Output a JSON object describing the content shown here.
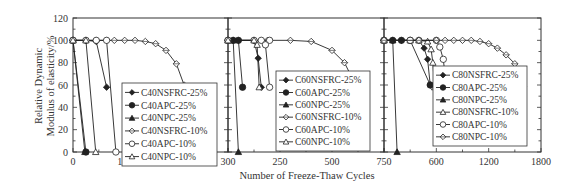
{
  "chart_data": {
    "type": "line",
    "title": "",
    "xlabel": "Number of Freeze-Thaw Cycles",
    "ylabel": "Relative Dynamic Modulus of elasticity/%",
    "ylabel_lines": [
      "Relative Dynamic",
      "Modulus of elasticity/%"
    ],
    "ylim": [
      0,
      120
    ],
    "yticks": [
      0,
      20,
      40,
      60,
      80,
      100,
      120
    ],
    "grid": false,
    "legend_position": "inside-right",
    "panels": [
      {
        "name": "C40",
        "xlim": [
          0,
          300
        ],
        "xticks": [
          0,
          100,
          200,
          300
        ],
        "xtick_labels": [
          "0",
          "100",
          "200",
          "300"
        ],
        "series": [
          {
            "name": "C40NSFRC-25%",
            "marker": "diamond-filled",
            "x": [
              0,
              25,
              45,
              65
            ],
            "y": [
              100,
              100,
              99,
              58
            ]
          },
          {
            "name": "C40APC-25%",
            "marker": "circle-filled",
            "x": [
              0,
              25
            ],
            "y": [
              100,
              0
            ]
          },
          {
            "name": "C40NPC-25%",
            "marker": "triangle-filled",
            "x": [
              0,
              23
            ],
            "y": [
              100,
              0
            ]
          },
          {
            "name": "C40NSFRC-10%",
            "marker": "diamond-open",
            "x": [
              0,
              25,
              45,
              65,
              80,
              100,
              120,
              140,
              160,
              180,
              200,
              215
            ],
            "y": [
              100,
              100,
              100,
              100,
              100,
              100,
              100,
              99,
              97,
              91,
              79,
              60
            ]
          },
          {
            "name": "C40APC-10%",
            "marker": "circle-open",
            "x": [
              0,
              25,
              45,
              65,
              83
            ],
            "y": [
              100,
              100,
              100,
              100,
              0
            ]
          },
          {
            "name": "C40NPC-10%",
            "marker": "triangle-open",
            "x": [
              0,
              25,
              44
            ],
            "y": [
              100,
              100,
              0
            ]
          }
        ],
        "legend": [
          "C40NSFRC-25%",
          "C40APC-25%",
          "C40NPC-25%",
          "C40NSFRC-10%",
          "C40APC-10%",
          "C40NPC-10%"
        ]
      },
      {
        "name": "C60",
        "xlim": [
          0,
          750
        ],
        "xticks": [
          0,
          250,
          500,
          750
        ],
        "xtick_labels": [
          "",
          "250",
          "500",
          "750"
        ],
        "series": [
          {
            "name": "C60NSFRC-25%",
            "marker": "diamond-filled",
            "x": [
              0,
              25,
              50,
              125,
              145,
              160
            ],
            "y": [
              100,
              100,
              100,
              100,
              84,
              58
            ]
          },
          {
            "name": "C60APC-25%",
            "marker": "circle-filled",
            "x": [
              0,
              25,
              50,
              70
            ],
            "y": [
              100,
              100,
              100,
              58
            ]
          },
          {
            "name": "C60NPC-25%",
            "marker": "triangle-filled",
            "x": [
              0,
              25,
              50
            ],
            "y": [
              100,
              100,
              0
            ]
          },
          {
            "name": "C60NSFRC-10%",
            "marker": "diamond-open",
            "x": [
              0,
              125,
              190,
              300,
              400,
              500,
              560,
              600,
              620
            ],
            "y": [
              100,
              100,
              100,
              100,
              99,
              91,
              80,
              65,
              58
            ]
          },
          {
            "name": "C60APC-10%",
            "marker": "circle-open",
            "x": [
              0,
              125,
              160,
              200,
              180,
              200
            ],
            "y": [
              100,
              100,
              100,
              100,
              96,
              58
            ]
          },
          {
            "name": "C60NPC-10%",
            "marker": "triangle-open",
            "x": [
              0,
              125,
              140,
              150
            ],
            "y": [
              100,
              100,
              96,
              58
            ]
          }
        ],
        "legend": [
          "C60NSFRC-25%",
          "C60APC-25%",
          "C60NPC-25%",
          "C60NSFRC-10%",
          "C60APC-10%",
          "C60NPC-10%"
        ]
      },
      {
        "name": "C80",
        "xlim": [
          0,
          1800
        ],
        "xticks": [
          0,
          600,
          1200,
          1800
        ],
        "xtick_labels": [
          "",
          "600",
          "1200",
          "1800"
        ],
        "series": [
          {
            "name": "C80NSFRC-25%",
            "marker": "diamond-filled",
            "x": [
              0,
              100,
              200,
              300,
              400,
              460,
              500,
              530
            ],
            "y": [
              100,
              100,
              100,
              100,
              100,
              93,
              83,
              60
            ]
          },
          {
            "name": "C80APC-25%",
            "marker": "circle-filled",
            "x": [
              0,
              100,
              200,
              300,
              530
            ],
            "y": [
              100,
              100,
              100,
              100,
              60
            ]
          },
          {
            "name": "C80NPC-25%",
            "marker": "triangle-filled",
            "x": [
              0,
              100,
              150
            ],
            "y": [
              100,
              100,
              0
            ]
          },
          {
            "name": "C80NSFRC-10%",
            "marker": "triangle-open",
            "x": [
              0,
              300,
              400,
              500,
              540,
              560,
              580
            ],
            "y": [
              100,
              100,
              100,
              99,
              92,
              80,
              58
            ]
          },
          {
            "name": "C80APC-10%",
            "marker": "circle-open",
            "x": [
              0,
              300,
              400,
              600,
              640,
              680,
              700,
              720
            ],
            "y": [
              100,
              100,
              100,
              100,
              94,
              83,
              69,
              45
            ]
          },
          {
            "name": "C80NPC-10%",
            "marker": "diamond-open",
            "x": [
              0,
              400,
              600,
              700,
              800,
              900,
              1000,
              1100,
              1200,
              1300,
              1400,
              1500,
              1600
            ],
            "y": [
              100,
              100,
              100,
              100,
              100,
              100,
              100,
              99,
              97,
              93,
              87,
              79,
              59
            ]
          }
        ],
        "legend": [
          "C80NSFRC-25%",
          "C80APC-25%",
          "C80NPC-25%",
          "C80NSFRC-10%",
          "C80APC-10%",
          "C80NPC-10%"
        ]
      }
    ]
  },
  "colors": {
    "axis": "#333333",
    "line": "#222222",
    "background": "#ffffff"
  }
}
